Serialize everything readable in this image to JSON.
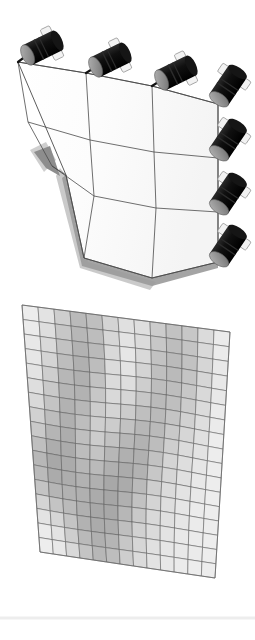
{
  "figure": {
    "title": "Actuated flexible panel: shape-control assembly and FEM displacement contour",
    "background_color": "#ffffff",
    "width": 255,
    "height": 640,
    "panels": [
      {
        "id": "top",
        "name": "actuator-assembly-render",
        "caption": "Deformed panel with linear actuators"
      },
      {
        "id": "bottom",
        "name": "fem-mesh-contour",
        "caption": "Finite element mesh with grayscale displacement contour"
      }
    ]
  },
  "assembly": {
    "name": "shape-control-panel-assembly",
    "surface": {
      "name": "flexible-panel-surface",
      "fill_color": "#fdfdfd",
      "edge_color": "#4a4a4a",
      "patch_rows": 3,
      "patch_cols": 3,
      "thickness_edge_color": "#9a9a9a",
      "shadow_color": "#b8b8b8",
      "outline": [
        [
          18,
          62
        ],
        [
          86,
          73
        ],
        [
          152,
          86
        ],
        [
          218,
          104
        ],
        [
          218,
          262
        ],
        [
          152,
          278
        ],
        [
          84,
          258
        ],
        [
          66,
          175
        ]
      ],
      "row_lines": [
        [
          [
            18,
            62
          ],
          [
            86,
            73
          ],
          [
            152,
            86
          ],
          [
            218,
            104
          ]
        ],
        [
          [
            28,
            122
          ],
          [
            90,
            140
          ],
          [
            154,
            152
          ],
          [
            218,
            158
          ]
        ],
        [
          [
            52,
            166
          ],
          [
            94,
            196
          ],
          [
            156,
            208
          ],
          [
            218,
            212
          ]
        ],
        [
          [
            66,
            175
          ],
          [
            84,
            258
          ],
          [
            152,
            278
          ],
          [
            218,
            262
          ]
        ]
      ],
      "col_lines": [
        [
          [
            18,
            62
          ],
          [
            28,
            122
          ],
          [
            52,
            166
          ],
          [
            66,
            175
          ]
        ],
        [
          [
            86,
            73
          ],
          [
            90,
            140
          ],
          [
            94,
            196
          ],
          [
            84,
            258
          ]
        ],
        [
          [
            152,
            86
          ],
          [
            154,
            152
          ],
          [
            156,
            208
          ],
          [
            152,
            278
          ]
        ],
        [
          [
            218,
            104
          ],
          [
            218,
            158
          ],
          [
            218,
            212
          ],
          [
            218,
            262
          ]
        ]
      ]
    },
    "actuators": [
      {
        "id": "A1",
        "label": "actuator-top-1",
        "attach": [
          18,
          62
        ],
        "cx": 42,
        "cy": 48,
        "angle": -26,
        "length": 34,
        "radius": 11
      },
      {
        "id": "A2",
        "label": "actuator-top-2",
        "attach": [
          86,
          73
        ],
        "cx": 110,
        "cy": 60,
        "angle": -26,
        "length": 34,
        "radius": 11
      },
      {
        "id": "A3",
        "label": "actuator-top-3",
        "attach": [
          152,
          86
        ],
        "cx": 176,
        "cy": 73,
        "angle": -26,
        "length": 34,
        "radius": 11
      },
      {
        "id": "A4",
        "label": "actuator-right-1",
        "attach": [
          218,
          104
        ],
        "cx": 228,
        "cy": 86,
        "angle": -56,
        "length": 34,
        "radius": 11
      },
      {
        "id": "A5",
        "label": "actuator-right-2",
        "attach": [
          218,
          158
        ],
        "cx": 228,
        "cy": 140,
        "angle": -56,
        "length": 34,
        "radius": 11
      },
      {
        "id": "A6",
        "label": "actuator-right-3",
        "attach": [
          218,
          212
        ],
        "cx": 228,
        "cy": 194,
        "angle": -56,
        "length": 34,
        "radius": 11
      },
      {
        "id": "A7",
        "label": "actuator-right-4",
        "attach": [
          218,
          262
        ],
        "cx": 228,
        "cy": 246,
        "angle": -56,
        "length": 34,
        "radius": 11
      }
    ],
    "actuator_style": {
      "body_color": "#121212",
      "band_color": "#2c2c2c",
      "cap_color": "#8e8e8e",
      "cap_edge_color": "#5e5e5e",
      "rod_color": "#111111",
      "bracket_color": "#f2f2f2",
      "bracket_edge_color": "#9b9b9b"
    },
    "counts": {
      "actuators_total": 7,
      "actuators_top_edge": 3,
      "actuators_right_edge": 4
    }
  },
  "chart_data": {
    "type": "heatmap",
    "xlabel": "",
    "ylabel": "",
    "cols": 13,
    "rows": 17,
    "grid": true,
    "legend": "none",
    "colormap": "grayscale",
    "value_range": [
      0,
      1
    ],
    "mesh_corners": {
      "top_left": [
        22,
        305
      ],
      "top_right": [
        230,
        332
      ],
      "bottom_right": [
        215,
        578
      ],
      "bottom_left": [
        40,
        552
      ]
    },
    "mesh_line_color": "#5a5a5a",
    "values": [
      [
        0.1,
        0.18,
        0.34,
        0.5,
        0.46,
        0.3,
        0.2,
        0.22,
        0.36,
        0.44,
        0.4,
        0.24,
        0.12
      ],
      [
        0.12,
        0.22,
        0.4,
        0.52,
        0.48,
        0.28,
        0.18,
        0.24,
        0.4,
        0.48,
        0.42,
        0.26,
        0.12
      ],
      [
        0.14,
        0.26,
        0.44,
        0.56,
        0.5,
        0.26,
        0.16,
        0.26,
        0.44,
        0.5,
        0.44,
        0.28,
        0.14
      ],
      [
        0.16,
        0.3,
        0.48,
        0.58,
        0.48,
        0.24,
        0.18,
        0.3,
        0.46,
        0.5,
        0.42,
        0.28,
        0.14
      ],
      [
        0.18,
        0.34,
        0.52,
        0.58,
        0.44,
        0.24,
        0.22,
        0.34,
        0.48,
        0.48,
        0.4,
        0.26,
        0.14
      ],
      [
        0.22,
        0.38,
        0.54,
        0.56,
        0.4,
        0.26,
        0.28,
        0.4,
        0.5,
        0.46,
        0.36,
        0.24,
        0.12
      ],
      [
        0.26,
        0.42,
        0.56,
        0.52,
        0.36,
        0.3,
        0.36,
        0.46,
        0.5,
        0.42,
        0.32,
        0.22,
        0.12
      ],
      [
        0.32,
        0.48,
        0.58,
        0.48,
        0.34,
        0.36,
        0.44,
        0.52,
        0.5,
        0.38,
        0.28,
        0.2,
        0.1
      ],
      [
        0.38,
        0.54,
        0.6,
        0.46,
        0.36,
        0.44,
        0.52,
        0.56,
        0.48,
        0.34,
        0.24,
        0.18,
        0.1
      ],
      [
        0.46,
        0.6,
        0.62,
        0.48,
        0.42,
        0.52,
        0.58,
        0.58,
        0.44,
        0.3,
        0.22,
        0.16,
        0.1
      ],
      [
        0.52,
        0.64,
        0.62,
        0.52,
        0.5,
        0.58,
        0.62,
        0.56,
        0.4,
        0.28,
        0.2,
        0.14,
        0.1
      ],
      [
        0.5,
        0.62,
        0.6,
        0.56,
        0.58,
        0.64,
        0.62,
        0.5,
        0.34,
        0.24,
        0.18,
        0.14,
        0.1
      ],
      [
        0.42,
        0.54,
        0.56,
        0.58,
        0.62,
        0.66,
        0.58,
        0.44,
        0.3,
        0.22,
        0.16,
        0.12,
        0.1
      ],
      [
        0.3,
        0.42,
        0.5,
        0.58,
        0.64,
        0.64,
        0.52,
        0.38,
        0.26,
        0.2,
        0.16,
        0.12,
        0.1
      ],
      [
        0.18,
        0.28,
        0.42,
        0.56,
        0.62,
        0.6,
        0.46,
        0.32,
        0.24,
        0.18,
        0.14,
        0.12,
        0.1
      ],
      [
        0.12,
        0.18,
        0.34,
        0.5,
        0.58,
        0.54,
        0.4,
        0.28,
        0.2,
        0.16,
        0.14,
        0.12,
        0.1
      ],
      [
        0.1,
        0.14,
        0.26,
        0.42,
        0.52,
        0.48,
        0.34,
        0.24,
        0.18,
        0.14,
        0.12,
        0.1,
        0.1
      ]
    ]
  },
  "baseline": {
    "name": "ground-line",
    "color": "#ededed",
    "y": 618
  }
}
